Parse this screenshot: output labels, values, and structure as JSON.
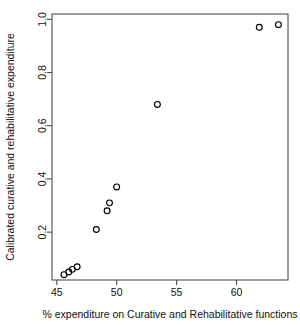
{
  "chart_data": {
    "type": "scatter",
    "title": "",
    "xlabel": "% expenditure on Curative and Rehabilitative functions",
    "ylabel": "Calibrated curative and rehabilitative expenditure",
    "xlim": [
      44.6,
      64.3
    ],
    "ylim": [
      0.02,
      1.02
    ],
    "grid": false,
    "legend": null,
    "xticks": [
      45,
      50,
      55,
      60
    ],
    "xtick_labels": [
      "45",
      "50",
      "55",
      "60"
    ],
    "yticks": [
      0.2,
      0.4,
      0.6,
      0.8,
      1.0
    ],
    "ytick_labels": [
      "0.2",
      "0.4",
      "0.6",
      "0.8",
      "1.0"
    ],
    "marker": "open-circle",
    "marker_color": "#000000",
    "points": [
      {
        "x": 45.6,
        "y": 0.04
      },
      {
        "x": 46.0,
        "y": 0.05
      },
      {
        "x": 46.3,
        "y": 0.06
      },
      {
        "x": 46.7,
        "y": 0.07
      },
      {
        "x": 48.3,
        "y": 0.21
      },
      {
        "x": 49.2,
        "y": 0.28
      },
      {
        "x": 49.4,
        "y": 0.31
      },
      {
        "x": 50.0,
        "y": 0.37
      },
      {
        "x": 53.4,
        "y": 0.68
      },
      {
        "x": 61.9,
        "y": 0.97
      },
      {
        "x": 63.5,
        "y": 0.98
      }
    ]
  }
}
